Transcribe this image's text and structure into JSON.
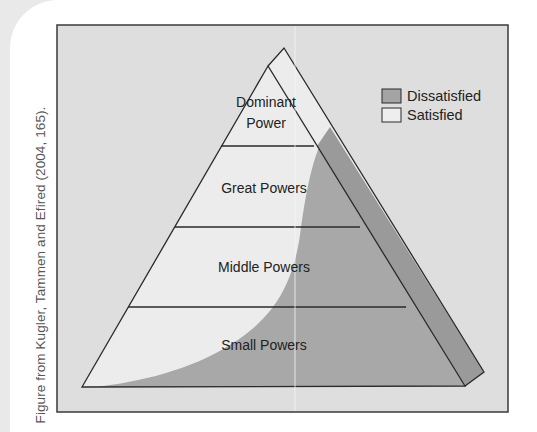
{
  "caption": "Figure from Kugler, Tammen and Efired (2004, 165).",
  "diagram": {
    "type": "pyramid",
    "tiers": [
      {
        "label_line1": "Dominant",
        "label_line2": "Power"
      },
      {
        "label": "Great Powers"
      },
      {
        "label": "Middle Powers"
      },
      {
        "label": "Small Powers"
      }
    ],
    "legend": [
      {
        "label": "Dissatisfied",
        "color": "#a4a4a4"
      },
      {
        "label": "Satisfied",
        "color": "#eeeeee"
      }
    ]
  },
  "colors": {
    "background": "#dedede",
    "satisfied": "#ececec",
    "dissatisfied_face": "#a8a8a8",
    "dissatisfied_side": "#9a9a9a",
    "outline": "#2a2a2a"
  }
}
